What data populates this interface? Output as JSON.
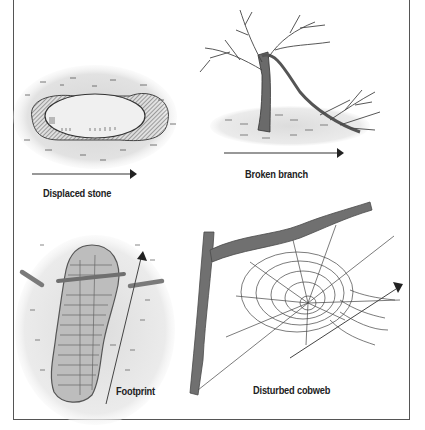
{
  "figure": {
    "title_partial": "",
    "panels": [
      {
        "id": "displaced-stone",
        "label": "Displaced stone",
        "arrow_direction": "right"
      },
      {
        "id": "broken-branch",
        "label": "Broken branch",
        "arrow_direction": "right"
      },
      {
        "id": "footprint",
        "label": "Footprint",
        "arrow_direction": "up"
      },
      {
        "id": "disturbed-cobweb",
        "label": "Disturbed cobweb",
        "arrow_direction": "up-right"
      }
    ]
  },
  "colors": {
    "frame": "#555555",
    "ink": "#2a2a2a",
    "ground": "#d9d9d9",
    "stone_fill": "#efefef",
    "wood": "#6f6f6f",
    "sole": "#bdbdbd"
  }
}
